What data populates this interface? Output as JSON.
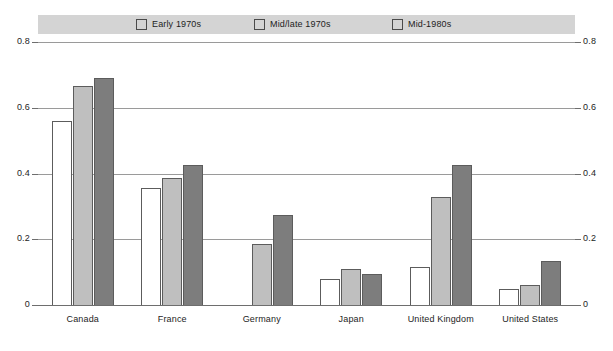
{
  "chart_data": {
    "type": "bar",
    "title": "",
    "subtitle": "",
    "xlabel": "",
    "ylabel": "",
    "ylim": [
      0,
      0.8
    ],
    "ytick_labels_left": [
      "0.8",
      "0.6",
      "0.4",
      "0.2",
      "0"
    ],
    "ytick_labels_right": [
      "0.8",
      "0.6",
      "0.4",
      "0.2",
      "0"
    ],
    "yticks": [
      0.8,
      0.6,
      0.4,
      0.2,
      0
    ],
    "grid": true,
    "legend_position": "top",
    "categories": [
      "Canada",
      "France",
      "Germany",
      "Japan",
      "United Kingdom",
      "United States"
    ],
    "series": [
      {
        "name": "Early 1970s",
        "color": "#ffffff",
        "values": [
          0.56,
          0.355,
          null,
          0.08,
          0.115,
          0.05
        ]
      },
      {
        "name": "Mid/late 1970s",
        "color": "#bfbfbf",
        "values": [
          0.665,
          0.385,
          0.185,
          0.11,
          0.33,
          0.06
        ]
      },
      {
        "name": "Mid-1980s",
        "color": "#7d7d7d",
        "values": [
          0.69,
          0.425,
          0.275,
          0.095,
          0.425,
          0.135
        ]
      }
    ]
  },
  "legend": {
    "items": [
      {
        "label": "Early 1970s"
      },
      {
        "label": "Mid/late 1970s"
      },
      {
        "label": "Mid-1980s"
      }
    ]
  },
  "axis": {
    "left": [
      "0.8",
      "0.6",
      "0.4",
      "0.2",
      "0"
    ],
    "right": [
      "0.8",
      "0.6",
      "0.4",
      "0.2",
      "0"
    ]
  },
  "categories": [
    {
      "label": "Canada"
    },
    {
      "label": "France"
    },
    {
      "label": "Germany"
    },
    {
      "label": "Japan"
    },
    {
      "label": "United Kingdom"
    },
    {
      "label": "United States"
    }
  ],
  "colors": {
    "series_early": "#ffffff",
    "series_midlate": "#bfbfbf",
    "series_mid80s": "#7d7d7d",
    "legend_band": "#d4d4d4",
    "gridline": "#9a9a9a",
    "bar_outline": "#5c5c5c",
    "text": "#1d1d1d"
  }
}
